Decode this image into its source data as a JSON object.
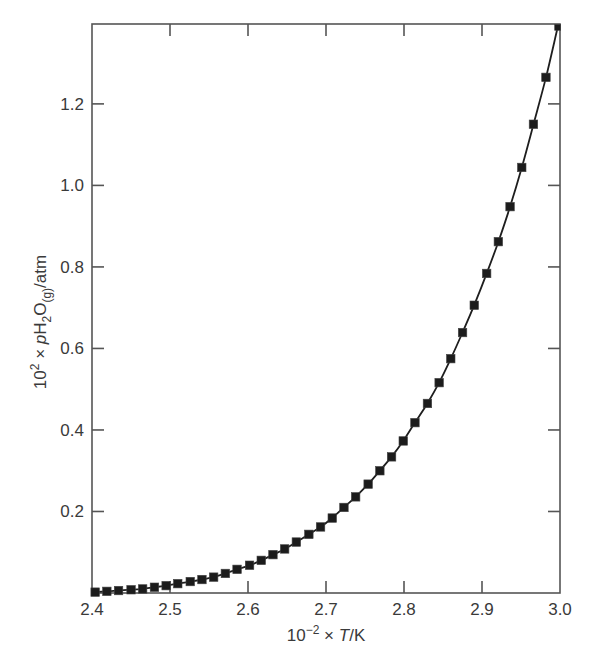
{
  "chart_data": {
    "type": "scatter",
    "title": "",
    "xlabel": "10^-2 × T/K",
    "ylabel": "10^2 × pH2O(g)/atm",
    "xlabel_parts": {
      "base": "10",
      "exp": "−2",
      "rest_pre": " × ",
      "italic": "T",
      "rest_post": "/K"
    },
    "ylabel_parts": {
      "base": "10",
      "exp": "2",
      "times": " × ",
      "italic": "p",
      "h": "H",
      "sub2": "2",
      "o": "O",
      "subg": "(g)",
      "unit": "/atm"
    },
    "xlim": [
      2.4,
      3.0
    ],
    "ylim": [
      0.0,
      1.396
    ],
    "grid": false,
    "legend": null,
    "x_ticks": [
      2.4,
      2.5,
      2.6,
      2.7,
      2.8,
      2.9,
      3.0
    ],
    "x_tick_labels": [
      "2.4",
      "2.5",
      "2.6",
      "2.7",
      "2.8",
      "2.9",
      "3.0"
    ],
    "y_ticks": [
      0.2,
      0.4,
      0.6,
      0.8,
      1.0,
      1.2
    ],
    "y_tick_labels": [
      "0.2",
      "0.4",
      "0.6",
      "0.8",
      "1.0",
      "1.2"
    ],
    "series": [
      {
        "name": "water vapour pressure",
        "marker": "square",
        "line": "smooth",
        "color": "#1c1c1c",
        "x": [
          2.404,
          2.419,
          2.434,
          2.45,
          2.465,
          2.48,
          2.495,
          2.51,
          2.526,
          2.541,
          2.556,
          2.571,
          2.586,
          2.602,
          2.617,
          2.632,
          2.647,
          2.662,
          2.678,
          2.693,
          2.708,
          2.723,
          2.738,
          2.754,
          2.769,
          2.784,
          2.799,
          2.814,
          2.83,
          2.845,
          2.86,
          2.875,
          2.89,
          2.906,
          2.921,
          2.936,
          2.951,
          2.966,
          2.982,
          2.997
        ],
        "values": [
          0.002,
          0.004,
          0.006,
          0.008,
          0.01,
          0.014,
          0.018,
          0.023,
          0.028,
          0.033,
          0.039,
          0.048,
          0.058,
          0.068,
          0.08,
          0.094,
          0.108,
          0.125,
          0.144,
          0.162,
          0.184,
          0.21,
          0.236,
          0.267,
          0.3,
          0.334,
          0.373,
          0.418,
          0.465,
          0.516,
          0.575,
          0.639,
          0.706,
          0.784,
          0.862,
          0.948,
          1.044,
          1.15,
          1.265,
          1.388
        ]
      }
    ]
  },
  "colors": {
    "axis": "#555555",
    "text": "#3a3a3a",
    "marker": "#1c1c1c",
    "background": "#ffffff"
  }
}
